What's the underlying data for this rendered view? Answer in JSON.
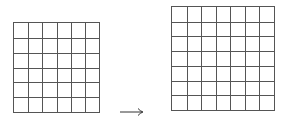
{
  "diagram": {
    "left_grid": {
      "rows": 6,
      "cols": 6,
      "x": 13,
      "y": 22,
      "width": 87,
      "height": 91
    },
    "right_grid": {
      "rows": 7,
      "cols": 7,
      "x": 171,
      "y": 6,
      "width": 104,
      "height": 105
    },
    "arrow": {
      "glyph": "⟶",
      "x": 119,
      "y": 103,
      "direction": "right"
    },
    "line_color": "#555555"
  }
}
